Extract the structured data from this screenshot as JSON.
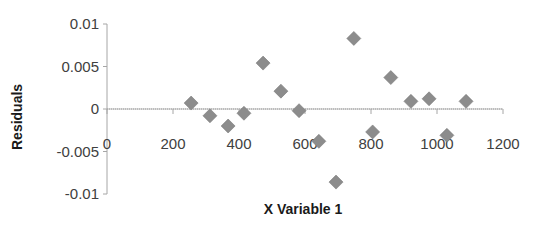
{
  "chart_data": {
    "type": "scatter",
    "title": "",
    "xlabel": "X Variable  1",
    "ylabel": "Residuals",
    "xlim": [
      0,
      1200
    ],
    "ylim": [
      -0.01,
      0.01
    ],
    "x_ticks": [
      0,
      200,
      400,
      600,
      800,
      1000,
      1200
    ],
    "x_tick_labels": [
      "0",
      "200",
      "400",
      "600",
      "800",
      "1000",
      "1200"
    ],
    "y_ticks": [
      0.01,
      0.005,
      0,
      -0.005,
      -0.01
    ],
    "y_tick_labels": [
      "0.01",
      "0.005",
      "0",
      "-0.005",
      "-0.01"
    ],
    "grid": false,
    "legend": null,
    "marker": "diamond",
    "marker_color": "#8c8c8c",
    "series": [
      {
        "name": "Residuals",
        "x": [
          255,
          312,
          367,
          415,
          473,
          527,
          582,
          642,
          694,
          748,
          805,
          860,
          921,
          976,
          1030,
          1088
        ],
        "y": [
          0.0007,
          -0.0008,
          -0.002,
          -0.0005,
          0.0054,
          0.0021,
          -0.0002,
          -0.0038,
          -0.0086,
          0.0083,
          -0.0027,
          0.0037,
          0.0009,
          0.0012,
          -0.0031,
          0.0009
        ]
      }
    ]
  }
}
